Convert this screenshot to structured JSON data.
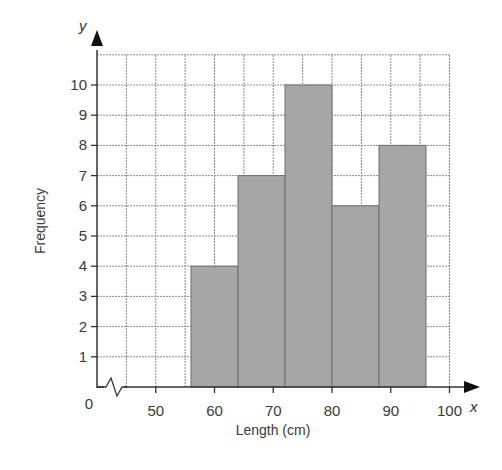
{
  "chart_data": {
    "type": "bar",
    "subtype": "histogram",
    "title": "",
    "xlabel": "Length (cm)",
    "ylabel": "Frequency",
    "x_axis_letter": "x",
    "y_axis_letter": "y",
    "bins": [
      {
        "from": 56,
        "to": 64,
        "frequency": 4
      },
      {
        "from": 64,
        "to": 72,
        "frequency": 7
      },
      {
        "from": 72,
        "to": 80,
        "frequency": 10
      },
      {
        "from": 80,
        "to": 88,
        "frequency": 6
      },
      {
        "from": 88,
        "to": 96,
        "frequency": 8
      }
    ],
    "categories": [
      "56-64",
      "64-72",
      "72-80",
      "80-88",
      "88-96"
    ],
    "values": [
      4,
      7,
      10,
      6,
      8
    ],
    "x_ticks": [
      "0",
      "50",
      "60",
      "70",
      "80",
      "90",
      "100"
    ],
    "y_ticks": [
      "1",
      "2",
      "3",
      "4",
      "5",
      "6",
      "7",
      "8",
      "9",
      "10"
    ],
    "xlim": [
      40,
      100
    ],
    "ylim": [
      0,
      11
    ],
    "x_axis_break": true,
    "grid": true,
    "bar_color": "#a6a6a6",
    "legend": null
  }
}
